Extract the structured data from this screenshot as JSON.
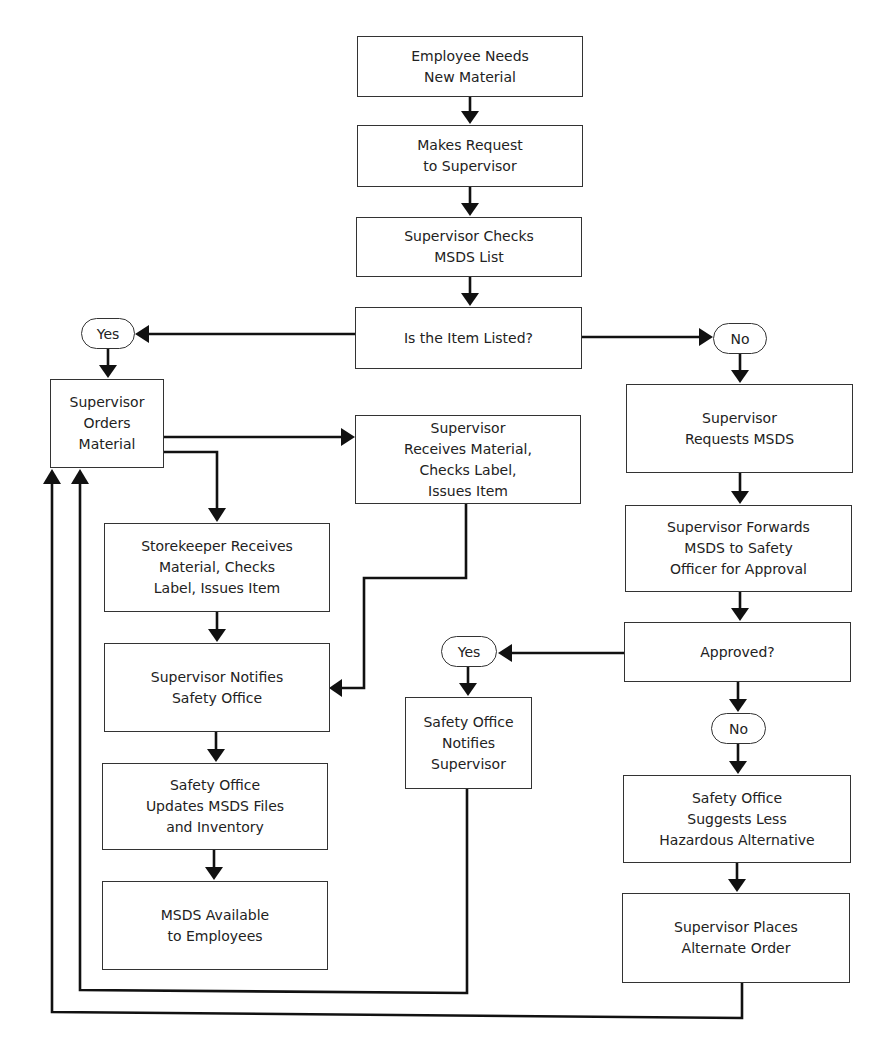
{
  "diagram": {
    "type": "flowchart",
    "nodes": {
      "employee_needs": "Employee Needs\nNew Material",
      "makes_request": "Makes Request\nto Supervisor",
      "checks_list": "Supervisor Checks\nMSDS List",
      "item_listed": "Is the Item Listed?",
      "yes_listed": "Yes",
      "no_listed": "No",
      "orders_material": "Supervisor\nOrders\nMaterial",
      "supervisor_receives": "Supervisor\nReceives Material,\nChecks Label,\nIssues Item",
      "storekeeper_receives": "Storekeeper Receives\nMaterial, Checks\nLabel, Issues Item",
      "notifies_safety": "Supervisor Notifies\nSafety Office",
      "updates_files": "Safety Office\nUpdates MSDS Files\nand Inventory",
      "msds_available": "MSDS Available\nto Employees",
      "requests_msds": "Supervisor\nRequests MSDS",
      "forwards_msds": "Supervisor Forwards\nMSDS to Safety\nOfficer for Approval",
      "approved": "Approved?",
      "yes_approved": "Yes",
      "no_approved": "No",
      "safety_notifies": "Safety Office\nNotifies\nSupervisor",
      "suggests_alternative": "Safety Office\nSuggests Less\nHazardous Alternative",
      "alternate_order": "Supervisor Places\nAlternate Order"
    },
    "edges": [
      [
        "employee_needs",
        "makes_request"
      ],
      [
        "makes_request",
        "checks_list"
      ],
      [
        "checks_list",
        "item_listed"
      ],
      [
        "item_listed",
        "yes_listed"
      ],
      [
        "item_listed",
        "no_listed"
      ],
      [
        "yes_listed",
        "orders_material"
      ],
      [
        "orders_material",
        "supervisor_receives"
      ],
      [
        "orders_material",
        "storekeeper_receives"
      ],
      [
        "storekeeper_receives",
        "notifies_safety"
      ],
      [
        "supervisor_receives",
        "notifies_safety"
      ],
      [
        "notifies_safety",
        "updates_files"
      ],
      [
        "updates_files",
        "msds_available"
      ],
      [
        "no_listed",
        "requests_msds"
      ],
      [
        "requests_msds",
        "forwards_msds"
      ],
      [
        "forwards_msds",
        "approved"
      ],
      [
        "approved",
        "yes_approved"
      ],
      [
        "approved",
        "no_approved"
      ],
      [
        "yes_approved",
        "safety_notifies"
      ],
      [
        "no_approved",
        "suggests_alternative"
      ],
      [
        "suggests_alternative",
        "alternate_order"
      ],
      [
        "safety_notifies",
        "orders_material"
      ],
      [
        "alternate_order",
        "orders_material"
      ]
    ],
    "colors": {
      "line": "#111111",
      "box_border": "#333333",
      "background": "#ffffff",
      "text": "#222222"
    }
  }
}
